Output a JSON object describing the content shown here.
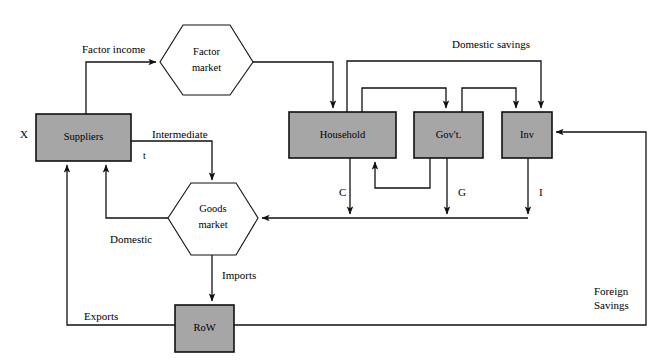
{
  "diagram": {
    "colors": {
      "box_fill": "#a6a6a6",
      "hex_fill": "#ffffff",
      "stroke": "#111111",
      "background": "#ffffff"
    },
    "nodes": [
      {
        "id": "suppliers",
        "label": "Suppliers",
        "shape": "rect"
      },
      {
        "id": "factor-market",
        "label": "Factor",
        "label2": "market",
        "shape": "hexagon"
      },
      {
        "id": "household",
        "label": "Household",
        "shape": "rect"
      },
      {
        "id": "government",
        "label": "Gov't.",
        "shape": "rect"
      },
      {
        "id": "investment",
        "label": "Inv",
        "shape": "rect"
      },
      {
        "id": "goods-market",
        "label": "Goods",
        "label2": "market",
        "shape": "hexagon"
      },
      {
        "id": "row",
        "label": "RoW",
        "shape": "rect"
      }
    ],
    "edge_labels": {
      "factor_income": "Factor income",
      "domestic_savings": "Domestic savings",
      "intermediate": "Intermediate",
      "tax_t": "t",
      "x_label": "X",
      "domestic": "Domestic",
      "imports": "Imports",
      "exports": "Exports",
      "consumption": "C",
      "government_spending": "G",
      "investment_demand": "I",
      "foreign_savings_line1": "Foreign",
      "foreign_savings_line2": "Savings"
    }
  }
}
